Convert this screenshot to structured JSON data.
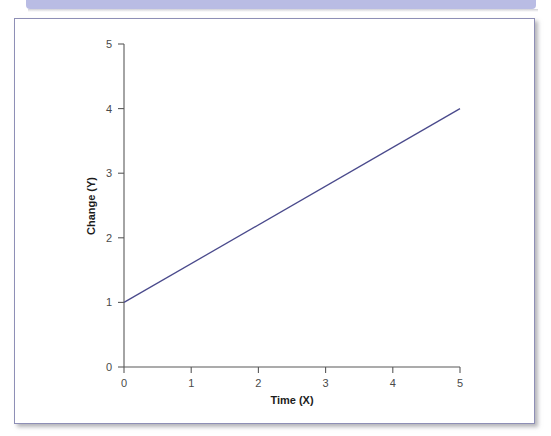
{
  "banner": {
    "color": "#b9bce4"
  },
  "frame": {
    "border_color": "#8e8fb6",
    "background": "#ffffff"
  },
  "chart_data": {
    "type": "line",
    "title": "",
    "subtitle": "",
    "xlabel": "Time (X)",
    "ylabel": "Change (Y)",
    "xlim": [
      0,
      5
    ],
    "ylim": [
      0,
      5
    ],
    "xticks": [
      0,
      1,
      2,
      3,
      4,
      5
    ],
    "yticks": [
      0,
      1,
      2,
      3,
      4,
      5
    ],
    "xticklabels": [
      "0",
      "1",
      "2",
      "3",
      "4",
      "5"
    ],
    "yticklabels": [
      "0",
      "1",
      "2",
      "3",
      "4",
      "5"
    ],
    "grid": false,
    "legend": null,
    "series": [
      {
        "name": "trend",
        "color": "#4a4a8c",
        "x": [
          0,
          5
        ],
        "values": [
          1,
          4
        ],
        "slope": 0.6,
        "intercept": 1
      }
    ],
    "annotations": []
  },
  "labels": {
    "y_tick_5": "5",
    "y_tick_4": "4",
    "y_tick_3": "3",
    "y_tick_2": "2",
    "y_tick_1": "1",
    "y_tick_0": "0",
    "x_tick_0": "0",
    "x_tick_1": "1",
    "x_tick_2": "2",
    "x_tick_3": "3",
    "x_tick_4": "4",
    "x_tick_5": "5",
    "x_axis_title": "Time (X)",
    "y_axis_title": "Change (Y)"
  }
}
